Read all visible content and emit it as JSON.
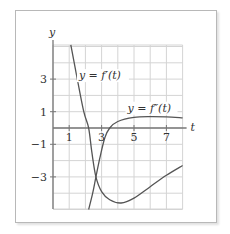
{
  "chart_data": {
    "type": "line",
    "title": "",
    "xlabel": "t",
    "ylabel": "y",
    "xlim": [
      0,
      8
    ],
    "ylim": [
      -5,
      5
    ],
    "grid": true,
    "x_ticks": [
      1,
      3,
      5,
      7
    ],
    "x_tick_labels": [
      "1",
      "3",
      "5",
      "7"
    ],
    "y_ticks": [
      3,
      1,
      -1,
      -3
    ],
    "y_tick_labels": [
      "3",
      "1",
      "−1",
      "−3"
    ],
    "series": [
      {
        "name": "y = f′(t)",
        "label": "y = f′(t)",
        "points": [
          [
            1.1,
            5.1
          ],
          [
            1.5,
            3
          ],
          [
            1.9,
            1
          ],
          [
            2.2,
            0
          ],
          [
            2.4,
            -1.5
          ],
          [
            2.65,
            -3
          ],
          [
            3,
            -3.9
          ],
          [
            3.5,
            -4.4
          ],
          [
            4.2,
            -4.6
          ],
          [
            5,
            -4.3
          ],
          [
            6,
            -3.6
          ],
          [
            7,
            -2.9
          ],
          [
            8,
            -2.3
          ]
        ]
      },
      {
        "name": "y = f″(t)",
        "label": "y = f″(t)",
        "points": [
          [
            2.2,
            -5
          ],
          [
            2.45,
            -4
          ],
          [
            2.65,
            -3
          ],
          [
            2.9,
            -1.8
          ],
          [
            3.2,
            -0.6
          ],
          [
            3.5,
            0
          ],
          [
            4,
            0.4
          ],
          [
            5,
            0.65
          ],
          [
            6,
            0.7
          ],
          [
            7,
            0.68
          ],
          [
            8,
            0.62
          ]
        ]
      }
    ],
    "annotations": [
      {
        "text": "y = f′(t)",
        "x": 1.6,
        "y": 3
      },
      {
        "text": "y = f″(t)",
        "x": 4.6,
        "y": 1
      }
    ],
    "colors": {
      "curve": "#555555",
      "grid": "#d4d4d4",
      "axis": "#777777"
    }
  }
}
